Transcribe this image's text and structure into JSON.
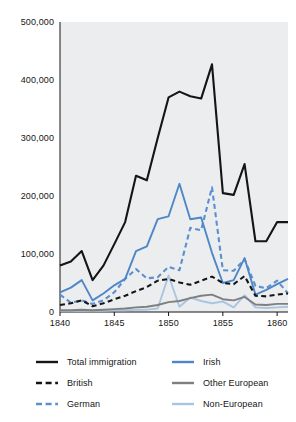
{
  "chart_data": {
    "type": "line",
    "title": "",
    "subtitle": "",
    "xlabel": "",
    "ylabel": "",
    "xlim": [
      1840,
      1861
    ],
    "ylim": [
      0,
      500000
    ],
    "grid": false,
    "legend_position": "bottom",
    "x": [
      1840,
      1841,
      1842,
      1843,
      1844,
      1845,
      1846,
      1847,
      1848,
      1849,
      1850,
      1851,
      1852,
      1853,
      1854,
      1855,
      1856,
      1857,
      1858,
      1859,
      1860,
      1861
    ],
    "xticks": [
      1840,
      1845,
      1850,
      1855,
      1860
    ],
    "xtick_labels": [
      "1840",
      "1845",
      "1850",
      "1855",
      "1860"
    ],
    "yticks": [
      0,
      100000,
      200000,
      300000,
      400000,
      500000
    ],
    "ytick_labels": [
      "0",
      "100,000",
      "200,000",
      "300,000",
      "400,000",
      "500,000"
    ],
    "series": [
      {
        "name": "Total immigration",
        "color": "#151515",
        "style": "solid",
        "width": 2.1,
        "values": [
          80000,
          87000,
          105000,
          55000,
          80000,
          117000,
          155000,
          235000,
          227000,
          300000,
          370000,
          380000,
          372000,
          368000,
          427000,
          205000,
          202000,
          255000,
          122000,
          122000,
          155000,
          155000
        ]
      },
      {
        "name": "Irish",
        "color": "#4d87c7",
        "style": "solid",
        "width": 1.9,
        "values": [
          34000,
          42000,
          55000,
          20000,
          32000,
          46000,
          57000,
          105000,
          113000,
          160000,
          165000,
          221000,
          160000,
          163000,
          102000,
          50000,
          55000,
          93000,
          30000,
          38000,
          48000,
          57000
        ]
      },
      {
        "name": "British",
        "color": "#151515",
        "style": "dashed",
        "width": 2.1,
        "values": [
          12000,
          15000,
          20000,
          10000,
          15000,
          22000,
          28000,
          36000,
          43000,
          54000,
          57000,
          51000,
          47000,
          54000,
          61000,
          50000,
          48000,
          62000,
          28000,
          27000,
          30000,
          32000
        ]
      },
      {
        "name": "German",
        "color": "#5b8fd0",
        "style": "dashed",
        "width": 2.1,
        "values": [
          30000,
          16000,
          20000,
          14000,
          20000,
          34000,
          57000,
          74000,
          58000,
          60000,
          78000,
          72000,
          145000,
          141000,
          215000,
          72000,
          71000,
          91000,
          45000,
          41000,
          54000,
          32000
        ]
      },
      {
        "name": "Other European",
        "color": "#7f7f7f",
        "style": "solid",
        "width": 1.9,
        "values": [
          3000,
          3000,
          4000,
          3000,
          4000,
          5000,
          6000,
          8000,
          9000,
          12000,
          17000,
          19000,
          24000,
          28000,
          30000,
          22000,
          20000,
          26000,
          13000,
          12000,
          14000,
          14000
        ]
      },
      {
        "name": "Non-European",
        "color": "#a9c5e2",
        "style": "solid",
        "width": 1.9,
        "values": [
          2000,
          2000,
          2000,
          2000,
          2000,
          3000,
          3000,
          4000,
          4000,
          6000,
          63000,
          9000,
          25000,
          19000,
          15000,
          18000,
          8000,
          29000,
          8000,
          7000,
          8000,
          9000
        ]
      }
    ],
    "legend": [
      {
        "label": "Total immigration",
        "color": "#151515",
        "style": "solid",
        "column": 0,
        "row": 0
      },
      {
        "label": "British",
        "color": "#151515",
        "style": "dashed",
        "column": 0,
        "row": 1
      },
      {
        "label": "German",
        "color": "#5b8fd0",
        "style": "dashed",
        "column": 0,
        "row": 2
      },
      {
        "label": "Irish",
        "color": "#4d87c7",
        "style": "solid",
        "column": 1,
        "row": 0
      },
      {
        "label": "Other European",
        "color": "#7f7f7f",
        "style": "solid",
        "column": 1,
        "row": 1
      },
      {
        "label": "Non-European",
        "color": "#a9c5e2",
        "style": "solid",
        "column": 1,
        "row": 2
      }
    ],
    "plot_background": "#ecedef",
    "figure_background": "#ffffff"
  }
}
